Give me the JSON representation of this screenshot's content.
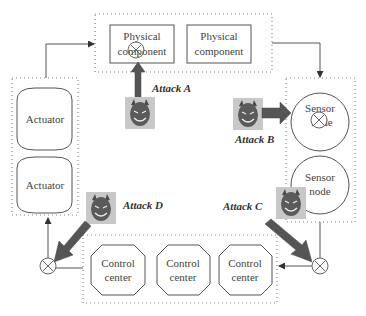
{
  "diagram": {
    "physical_components": [
      {
        "label_line1": "Physical",
        "label_line2": "component",
        "attacked": true
      },
      {
        "label_line1": "Physical",
        "label_line2": "component",
        "attacked": false
      }
    ],
    "actuators": [
      {
        "label": "Actuator"
      },
      {
        "label": "Actuator"
      }
    ],
    "sensor_nodes": [
      {
        "label_line1": "Sensor",
        "label_line2": "node",
        "attacked": true
      },
      {
        "label_line1": "Sensor",
        "label_line2": "node",
        "attacked": false
      }
    ],
    "control_centers": [
      {
        "label_line1": "Control",
        "label_line2": "center"
      },
      {
        "label_line1": "Control",
        "label_line2": "center"
      },
      {
        "label_line1": "Control",
        "label_line2": "center"
      }
    ],
    "attacks": [
      {
        "label": "Attack A",
        "target": "physical component"
      },
      {
        "label": "Attack B",
        "target": "sensor node"
      },
      {
        "label": "Attack C",
        "target": "sensor-to-control channel"
      },
      {
        "label": "Attack D",
        "target": "control-to-actuator channel"
      }
    ],
    "colors": {
      "line": "#555555",
      "attack_arrow": "#555555",
      "devil_bg": "#c8c8c8",
      "devil_face": "#5a5a5a"
    }
  }
}
